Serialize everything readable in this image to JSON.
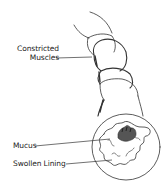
{
  "diagram": {
    "labels": {
      "constricted_muscles_line1": "Constricted",
      "constricted_muscles_line2": "Muscles",
      "mucus": "Mucus",
      "swollen_lining": "Swollen Lining"
    },
    "colors": {
      "line": "#333333",
      "background": "#ffffff",
      "mucus_fill": "#555555"
    }
  }
}
